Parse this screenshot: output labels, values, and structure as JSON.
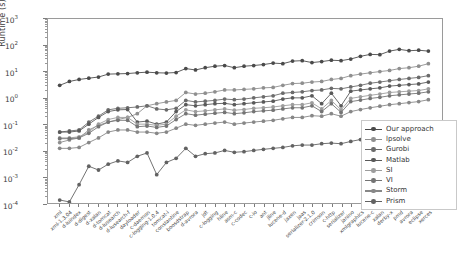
{
  "chart_data": {
    "type": "line",
    "title": "",
    "xlabel": "",
    "ylabel": "Runtime (s)",
    "yscale": "log",
    "ylim": [
      0.0001,
      1000
    ],
    "ytick_labels": [
      "10³",
      "10²",
      "10¹",
      "10⁰",
      "10⁻¹",
      "10⁻²",
      "10⁻³",
      "10⁻⁴"
    ],
    "ytick_values": [
      1000,
      100,
      10,
      1,
      0.1,
      0.01,
      0.001,
      0.0001
    ],
    "grid": false,
    "legend_position": "lower right",
    "categories": [
      "xml",
      "xml-1.3.04",
      "d-luindex",
      "d-digest",
      "d-xalan",
      "d-tomcat",
      "d-lusearch",
      "d-lusearch-f",
      "dayloader",
      "c-daemon",
      "c-logging-1.0.4",
      "tomcat-i",
      "constantine",
      "boosdstrap",
      "d-avrora",
      "jdt",
      "c-logging",
      "hline",
      "asm-c",
      "c-codec",
      "c-io",
      "ant",
      "jline",
      "lucene-d",
      "jaxen",
      "jaas",
      "serializer-2.1.0",
      "crimson",
      "c-http",
      "serializer",
      "janino",
      "xmlgraphics",
      "lucene-c",
      "xalan",
      "derby-x",
      "pmd",
      "avrora",
      "eclipse",
      "xerces"
    ],
    "series": [
      {
        "name": "Our approach",
        "color": "#4a4a4a",
        "values": [
          3.0,
          4.2,
          5.0,
          5.6,
          6.2,
          8.0,
          8.2,
          8.4,
          9.0,
          9.5,
          9.0,
          8.8,
          9.2,
          13.0,
          11.5,
          14.0,
          16.0,
          17.0,
          14.0,
          16.0,
          17.0,
          18.5,
          21.0,
          20.0,
          25.0,
          26.0,
          22.0,
          24.0,
          27.0,
          26.0,
          30.0,
          38.0,
          45.0,
          44.0,
          60.0,
          70.0,
          62.0,
          65.0,
          60.0
        ]
      },
      {
        "name": "lpsolve",
        "color": "#8f8f8f",
        "values": [
          0.02,
          0.025,
          0.03,
          0.06,
          0.09,
          0.12,
          0.15,
          0.18,
          0.25,
          0.5,
          0.6,
          0.7,
          0.8,
          1.6,
          1.4,
          1.5,
          1.7,
          2.0,
          2.0,
          2.1,
          2.2,
          2.4,
          2.5,
          3.0,
          3.5,
          3.6,
          4.0,
          4.2,
          5.0,
          5.5,
          7.0,
          8.0,
          9.0,
          10.0,
          11.0,
          13.0,
          14.0,
          16.0,
          20.0
        ]
      },
      {
        "name": "Gurobi",
        "color": "#6b6b6b",
        "values": [
          0.05,
          0.055,
          0.06,
          0.12,
          0.2,
          0.35,
          0.4,
          0.42,
          0.45,
          0.5,
          0.38,
          0.35,
          0.4,
          0.8,
          0.7,
          0.75,
          0.8,
          0.9,
          0.85,
          0.9,
          1.0,
          1.1,
          1.2,
          1.5,
          1.6,
          1.7,
          1.9,
          2.0,
          2.3,
          2.2,
          2.6,
          3.0,
          3.6,
          4.0,
          4.5,
          5.0,
          5.5,
          6.0,
          7.0
        ]
      },
      {
        "name": "Matlab",
        "color": "#5a5a5a",
        "values": [
          0.05,
          0.05,
          0.055,
          0.1,
          0.18,
          0.3,
          0.35,
          0.36,
          0.12,
          0.13,
          0.1,
          0.12,
          0.3,
          0.55,
          0.5,
          0.55,
          0.6,
          0.62,
          0.55,
          0.6,
          0.65,
          0.7,
          0.75,
          0.9,
          1.0,
          1.0,
          1.2,
          0.6,
          1.5,
          0.5,
          1.8,
          2.0,
          2.2,
          2.4,
          2.8,
          3.0,
          3.2,
          3.4,
          4.0
        ]
      },
      {
        "name": "SI",
        "color": "#9d9d9d",
        "values": [
          0.03,
          0.03,
          0.033,
          0.05,
          0.1,
          0.15,
          0.18,
          0.18,
          0.1,
          0.1,
          0.09,
          0.1,
          0.2,
          0.35,
          0.3,
          0.32,
          0.35,
          0.38,
          0.34,
          0.36,
          0.4,
          0.42,
          0.45,
          0.5,
          0.55,
          0.55,
          0.65,
          0.38,
          0.8,
          0.35,
          0.95,
          1.1,
          1.25,
          1.4,
          1.6,
          1.7,
          1.8,
          1.9,
          2.2
        ]
      },
      {
        "name": "VI",
        "color": "#747474",
        "values": [
          0.028,
          0.028,
          0.03,
          0.045,
          0.08,
          0.12,
          0.14,
          0.14,
          0.08,
          0.085,
          0.075,
          0.085,
          0.15,
          0.25,
          0.22,
          0.24,
          0.26,
          0.28,
          0.25,
          0.27,
          0.3,
          0.32,
          0.34,
          0.38,
          0.42,
          0.42,
          0.5,
          0.3,
          0.6,
          0.28,
          0.72,
          0.82,
          0.95,
          1.05,
          1.2,
          1.3,
          1.4,
          1.5,
          1.7
        ]
      },
      {
        "name": "Storm",
        "color": "#878787",
        "values": [
          0.012,
          0.012,
          0.013,
          0.02,
          0.03,
          0.05,
          0.06,
          0.06,
          0.05,
          0.05,
          0.045,
          0.05,
          0.07,
          0.1,
          0.09,
          0.1,
          0.11,
          0.12,
          0.1,
          0.11,
          0.12,
          0.13,
          0.14,
          0.16,
          0.18,
          0.18,
          0.21,
          0.2,
          0.25,
          0.2,
          0.3,
          0.36,
          0.42,
          0.48,
          0.55,
          0.6,
          0.66,
          0.72,
          0.85
        ]
      },
      {
        "name": "Prism",
        "color": "#626262",
        "values": [
          0.00013,
          0.00011,
          0.0005,
          0.0025,
          0.0018,
          0.003,
          0.004,
          0.0035,
          0.006,
          0.008,
          0.0012,
          0.0035,
          0.005,
          0.012,
          0.006,
          0.0075,
          0.008,
          0.01,
          0.0085,
          0.009,
          0.01,
          0.011,
          0.012,
          0.013,
          0.015,
          0.016,
          0.016,
          0.018,
          0.019,
          0.018,
          0.022,
          0.026,
          0.03,
          0.034,
          0.04,
          0.046,
          0.05,
          0.06,
          0.075
        ]
      }
    ]
  },
  "legend": {
    "entries": [
      {
        "label": "Our approach"
      },
      {
        "label": "lpsolve"
      },
      {
        "label": "Gurobi"
      },
      {
        "label": "Matlab"
      },
      {
        "label": "SI"
      },
      {
        "label": "VI"
      },
      {
        "label": "Storm"
      },
      {
        "label": "Prism"
      }
    ]
  }
}
